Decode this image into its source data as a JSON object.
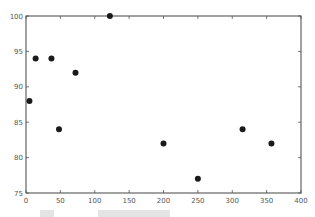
{
  "chart_data": {
    "type": "scatter",
    "title": "",
    "xlabel": "",
    "ylabel": "",
    "xlim": [
      0,
      400
    ],
    "ylim": [
      75,
      100
    ],
    "x_ticks": [
      0,
      50,
      100,
      150,
      200,
      250,
      300,
      350,
      400
    ],
    "y_ticks": [
      75,
      80,
      85,
      90,
      95,
      100
    ],
    "grid": false,
    "legend": null,
    "marker_color": "#1a1a1a",
    "series": [
      {
        "name": "points",
        "points": [
          {
            "x": 5,
            "y": 88
          },
          {
            "x": 14,
            "y": 94
          },
          {
            "x": 37,
            "y": 94
          },
          {
            "x": 48,
            "y": 84
          },
          {
            "x": 72,
            "y": 92
          },
          {
            "x": 122,
            "y": 100
          },
          {
            "x": 200,
            "y": 82
          },
          {
            "x": 250,
            "y": 77
          },
          {
            "x": 315,
            "y": 84
          },
          {
            "x": 357,
            "y": 82
          }
        ]
      }
    ]
  },
  "layout": {
    "plot_left": 26,
    "plot_top": 16,
    "plot_right": 301,
    "plot_bottom": 193
  }
}
